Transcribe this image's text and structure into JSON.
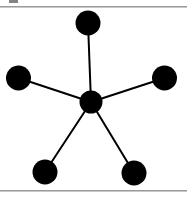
{
  "page": {
    "width": 187,
    "height": 197,
    "background_color": "#ffffff",
    "figure_type": "star-graph-diagram",
    "caption_text": ""
  },
  "rules": {
    "color": "#9a9a9a",
    "top_y": 6,
    "bottom_y": 190,
    "top_label": "",
    "bottom_label": ""
  },
  "artifacts": {
    "clipped_glyph_label": ""
  },
  "chart_data": {
    "type": "scatter",
    "title": "",
    "subtitle": "",
    "xlabel": "",
    "ylabel": "",
    "grid": false,
    "legend": "none",
    "xlim": [
      0,
      187
    ],
    "ylim": [
      0,
      197
    ],
    "node_color": "#000000",
    "edge_color": "#000000",
    "edge_width": 2,
    "nodes": [
      {
        "id": "hub",
        "label": "",
        "x": 91,
        "y": 102,
        "r": 11.5,
        "degree": 5
      },
      {
        "id": "top",
        "label": "",
        "x": 88,
        "y": 23,
        "r": 12.5,
        "degree": 1
      },
      {
        "id": "left",
        "label": "",
        "x": 18.5,
        "y": 78,
        "r": 12.5,
        "degree": 1
      },
      {
        "id": "right",
        "label": "",
        "x": 164.5,
        "y": 78,
        "r": 12.5,
        "degree": 1
      },
      {
        "id": "bottom-left",
        "label": "",
        "x": 45,
        "y": 172,
        "r": 12.5,
        "degree": 1
      },
      {
        "id": "bottom-right",
        "label": "",
        "x": 134,
        "y": 173,
        "r": 12.5,
        "degree": 1
      }
    ],
    "edges": [
      {
        "source": "hub",
        "target": "top",
        "label": ""
      },
      {
        "source": "hub",
        "target": "left",
        "label": ""
      },
      {
        "source": "hub",
        "target": "right",
        "label": ""
      },
      {
        "source": "hub",
        "target": "bottom-left",
        "label": ""
      },
      {
        "source": "hub",
        "target": "bottom-right",
        "label": ""
      }
    ],
    "node_count": 6,
    "edge_count": 5
  }
}
